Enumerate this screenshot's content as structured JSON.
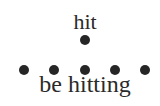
{
  "diagram": {
    "top_word": "hit",
    "bottom_word": "be hitting",
    "top_dots": [
      {
        "x": 85,
        "y": 40
      }
    ],
    "bottom_dots": [
      {
        "x": 24,
        "y": 70
      },
      {
        "x": 54,
        "y": 70
      },
      {
        "x": 85,
        "y": 70
      },
      {
        "x": 115,
        "y": 70
      },
      {
        "x": 145,
        "y": 70
      }
    ],
    "dot_color": "#262626",
    "text_color": "#2a2a2a"
  }
}
